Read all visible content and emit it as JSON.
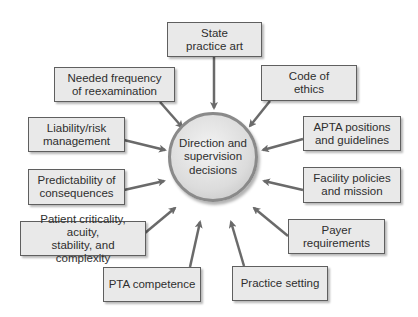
{
  "diagram": {
    "type": "hub-and-spoke",
    "center": {
      "label": "Direction and\nsupervision\ndecisions"
    },
    "factors": [
      {
        "id": "state-practice-act",
        "label": "State\npractice art"
      },
      {
        "id": "needed-frequency",
        "label": "Needed frequency\nof reexamination"
      },
      {
        "id": "code-of-ethics",
        "label": "Code of\nethics"
      },
      {
        "id": "liability-risk",
        "label": "Liability/risk\nmanagement"
      },
      {
        "id": "apta-positions",
        "label": "APTA positions\nand guidelines"
      },
      {
        "id": "predictability",
        "label": "Predictability of\nconsequences"
      },
      {
        "id": "facility-policies",
        "label": "Facility policies\nand mission"
      },
      {
        "id": "patient-criticality",
        "label": "Patient criticality, acuity,\nstability, and complexity"
      },
      {
        "id": "payer-requirements",
        "label": "Payer\nrequirements"
      },
      {
        "id": "pta-competence",
        "label": "PTA competence"
      },
      {
        "id": "practice-setting",
        "label": "Practice setting"
      }
    ],
    "colors": {
      "box_fill": "#e9e9e9",
      "box_border": "#5f5f5f",
      "arrow": "#6a6a6a",
      "circle_border": "#8a8a8a"
    }
  }
}
